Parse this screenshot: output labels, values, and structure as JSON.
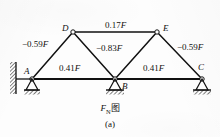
{
  "figure": {
    "caption_main_symbol": "F",
    "caption_main_sub": "N",
    "caption_main_word": "图",
    "caption_sub_label": "(a)",
    "ink_color": "#111111",
    "background_color": "#fdfdfd"
  },
  "nodes": [
    {
      "id": "A",
      "label": "A",
      "x": 32,
      "y": 79
    },
    {
      "id": "B",
      "label": "B",
      "x": 115,
      "y": 79
    },
    {
      "id": "C",
      "label": "C",
      "x": 202,
      "y": 79
    },
    {
      "id": "D",
      "label": "D",
      "x": 73,
      "y": 32
    },
    {
      "id": "E",
      "label": "E",
      "x": 157,
      "y": 32
    }
  ],
  "members": [
    {
      "id": "AD",
      "from": "A",
      "to": "D",
      "force": "-0.59F",
      "sign": "-",
      "magnitude": "0.59",
      "unit": "F"
    },
    {
      "id": "DE",
      "from": "D",
      "to": "E",
      "force": "0.17F",
      "sign": "+",
      "magnitude": "0.17",
      "unit": "F"
    },
    {
      "id": "DB",
      "from": "D",
      "to": "B",
      "force": "-0.83F",
      "sign": "-",
      "magnitude": "0.83",
      "unit": "F"
    },
    {
      "id": "EC",
      "from": "E",
      "to": "C",
      "force": "-0.59F",
      "sign": "-",
      "magnitude": "0.59",
      "unit": "F"
    },
    {
      "id": "AB",
      "from": "A",
      "to": "B",
      "force": "0.41F",
      "sign": "+",
      "magnitude": "0.41",
      "unit": "F"
    },
    {
      "id": "BC",
      "from": "B",
      "to": "C",
      "force": "0.41F",
      "sign": "+",
      "magnitude": "0.41",
      "unit": "F"
    },
    {
      "id": "BE",
      "from": "B",
      "to": "E",
      "force": "",
      "sign": "",
      "magnitude": "",
      "unit": ""
    }
  ],
  "force_labels": {
    "ad": {
      "prefix": "−",
      "value": "0.59",
      "unit": "F"
    },
    "de": {
      "prefix": "",
      "value": "0.17",
      "unit": "F"
    },
    "db": {
      "prefix": "−",
      "value": "0.83",
      "unit": "F"
    },
    "ec": {
      "prefix": "−",
      "value": "0.59",
      "unit": "F"
    },
    "ab": {
      "prefix": "",
      "value": "0.41",
      "unit": "F"
    },
    "bc": {
      "prefix": "",
      "value": "0.41",
      "unit": "F"
    }
  },
  "node_labels": {
    "a": "A",
    "b": "B",
    "c": "C",
    "d": "D",
    "e": "E"
  },
  "supports": [
    {
      "id": "A",
      "type": "pin-with-wall",
      "x": 32,
      "y": 79
    },
    {
      "id": "B",
      "type": "pin",
      "x": 115,
      "y": 79
    },
    {
      "id": "C",
      "type": "pin",
      "x": 202,
      "y": 79
    }
  ]
}
